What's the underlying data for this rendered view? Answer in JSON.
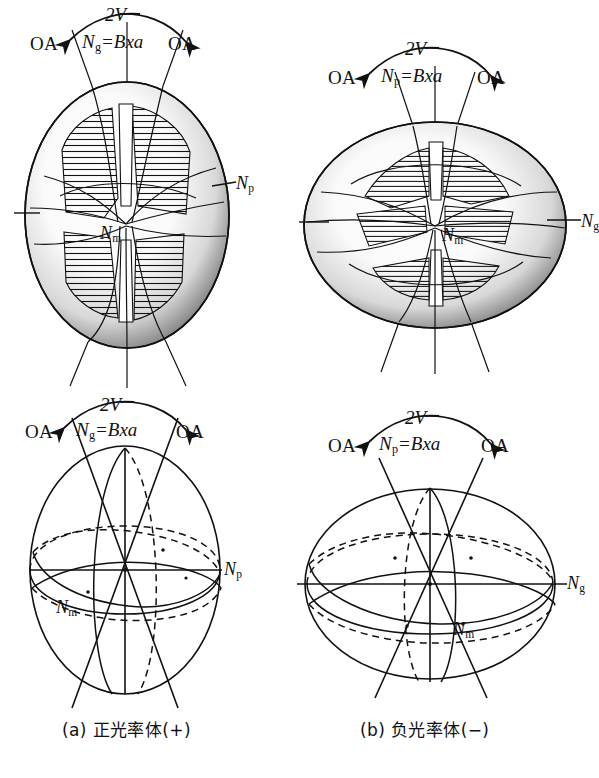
{
  "figure": {
    "type": "optical-indicatrix-diagram",
    "panels": [
      {
        "id": "a",
        "caption": "(a) 正光率体(+)",
        "sign": "+",
        "shape": "prolate",
        "optic_sign_name": "positive",
        "bxa_axis": "Ng",
        "labels": {
          "oa_left": "OA",
          "oa_right": "OA",
          "angle": "2V",
          "bxa": "N",
          "bxa_sub": "g",
          "bxa_eq": "=Bxa",
          "axis_side": "N",
          "axis_side_sub": "p",
          "axis_mid": "N",
          "axis_mid_sub": "m"
        }
      },
      {
        "id": "b",
        "caption": "(b) 负光率体(−)",
        "sign": "−",
        "shape": "oblate",
        "optic_sign_name": "negative",
        "bxa_axis": "Np",
        "labels": {
          "oa_left": "OA",
          "oa_right": "OA",
          "angle": "2V",
          "bxa": "N",
          "bxa_sub": "p",
          "bxa_eq": "=Bxa",
          "axis_side": "N",
          "axis_side_sub": "g",
          "axis_mid": "N",
          "axis_mid_sub": "m"
        }
      }
    ],
    "rows": [
      {
        "id": "top",
        "style": "shaded-stippled-model"
      },
      {
        "id": "bottom",
        "style": "wireframe-schematic"
      }
    ],
    "colors": {
      "ink": "#111111",
      "paper": "#ffffff",
      "stipple": "#2a2a2a"
    }
  }
}
